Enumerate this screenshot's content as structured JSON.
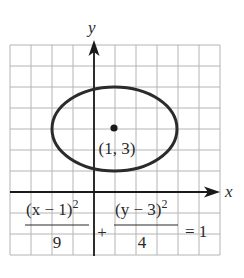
{
  "figure": {
    "type": "ellipse-graph",
    "axes": {
      "x_label": "x",
      "y_label": "y",
      "x_range": [
        -4,
        6
      ],
      "y_range": [
        -3,
        7
      ],
      "grid": true,
      "grid_step": 1
    },
    "ellipse": {
      "center": [
        1,
        3
      ],
      "semi_axis_x": 3,
      "semi_axis_y": 2,
      "center_label": "(1, 3)"
    },
    "equation": {
      "term1_numerator_base": "(x − 1)",
      "term1_exponent": "2",
      "term1_denominator": "9",
      "plus": "+",
      "term2_numerator_base": "(y − 3)",
      "term2_exponent": "2",
      "term2_denominator": "4",
      "rhs": "= 1"
    },
    "colors": {
      "grid": "#b4b4b4",
      "axes": "#1a1a1a",
      "ellipse": "#2b2b2b",
      "text": "#2a2a2a"
    }
  }
}
